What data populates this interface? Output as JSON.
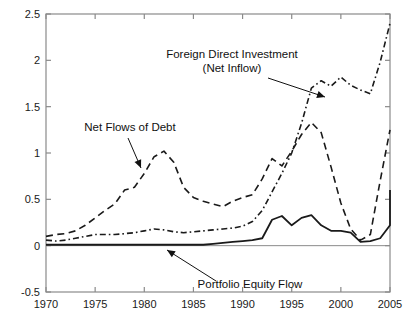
{
  "figure": {
    "background": "#ffffff",
    "plot_frame_color": "#8a8a8a",
    "line_color": "#1a1a1a"
  },
  "annotations": {
    "fdi_line1": "Foreign Direct Investment",
    "fdi_line2": "(Net Inflow)",
    "debt": "Net Flows of Debt",
    "portfolio": "Portfolio Equity Flow"
  },
  "chart_data": {
    "type": "line",
    "title": "",
    "xlabel": "",
    "ylabel": "",
    "xlim": [
      1970,
      2005
    ],
    "ylim": [
      -0.5,
      2.5
    ],
    "grid": false,
    "legend": "annotated-inline",
    "xticks": [
      1970,
      1975,
      1980,
      1985,
      1990,
      1995,
      2000,
      2005
    ],
    "xtick_labels": [
      "1970",
      "1975",
      "1980",
      "1985",
      "1990",
      "1995",
      "2000",
      "2005"
    ],
    "yticks": [
      -0.5,
      0,
      0.5,
      1,
      1.5,
      2,
      2.5
    ],
    "ytick_labels": [
      "-0.5",
      "0",
      "0.5",
      "1",
      "1.5",
      "2",
      "2.5"
    ],
    "x": [
      1970,
      1971,
      1972,
      1973,
      1974,
      1975,
      1976,
      1977,
      1978,
      1979,
      1980,
      1981,
      1982,
      1983,
      1984,
      1985,
      1986,
      1987,
      1988,
      1989,
      1990,
      1991,
      1992,
      1993,
      1994,
      1995,
      1996,
      1997,
      1998,
      1999,
      2000,
      2001,
      2002,
      2003,
      2004,
      2005
    ],
    "series": [
      {
        "name": "Net Flows of Debt",
        "style": "dashed",
        "values": [
          0.1,
          0.12,
          0.13,
          0.16,
          0.22,
          0.3,
          0.38,
          0.45,
          0.6,
          0.63,
          0.78,
          0.96,
          1.02,
          0.9,
          0.63,
          0.52,
          0.48,
          0.45,
          0.42,
          0.48,
          0.52,
          0.55,
          0.72,
          0.94,
          0.86,
          1.02,
          1.2,
          1.33,
          1.22,
          0.85,
          0.46,
          0.18,
          0.06,
          0.12,
          0.7,
          1.25
        ]
      },
      {
        "name": "Foreign Direct Investment (Net Inflow)",
        "style": "dash-dot",
        "values": [
          0.06,
          0.05,
          0.06,
          0.08,
          0.1,
          0.12,
          0.12,
          0.12,
          0.13,
          0.14,
          0.16,
          0.18,
          0.17,
          0.15,
          0.14,
          0.15,
          0.16,
          0.17,
          0.18,
          0.19,
          0.21,
          0.26,
          0.38,
          0.58,
          0.78,
          1.0,
          1.32,
          1.7,
          1.78,
          1.72,
          1.82,
          1.73,
          1.68,
          1.64,
          1.98,
          2.4
        ]
      },
      {
        "name": "Portfolio Equity Flow",
        "style": "solid",
        "values": [
          0.01,
          0.01,
          0.01,
          0.01,
          0.01,
          0.01,
          0.01,
          0.01,
          0.01,
          0.01,
          0.01,
          0.01,
          0.01,
          0.01,
          0.01,
          0.01,
          0.01,
          0.02,
          0.03,
          0.04,
          0.05,
          0.06,
          0.08,
          0.28,
          0.32,
          0.22,
          0.3,
          0.33,
          0.22,
          0.16,
          0.16,
          0.14,
          0.04,
          0.05,
          0.08,
          0.22
        ],
        "values_tail": [
          0.22,
          0.4,
          0.6
        ]
      }
    ]
  }
}
